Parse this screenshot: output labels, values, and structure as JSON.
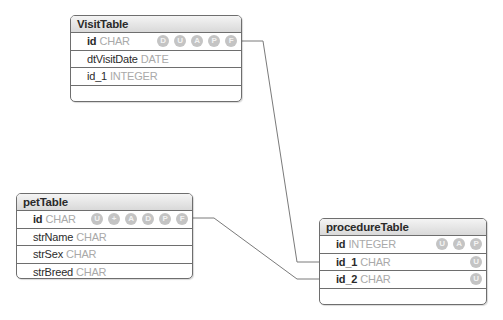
{
  "tables": {
    "visit": {
      "name": "VisitTable",
      "fields": [
        {
          "name": "id",
          "type": "CHAR",
          "icons": [
            "D",
            "U",
            "A",
            "P",
            "F"
          ]
        },
        {
          "name": "dtVisitDate",
          "type": "DATE",
          "icons": []
        },
        {
          "name": "id_1",
          "type": "INTEGER",
          "icons": []
        }
      ]
    },
    "pet": {
      "name": "petTable",
      "fields": [
        {
          "name": "id",
          "type": "CHAR",
          "icons": [
            "U",
            "+",
            "A",
            "D",
            "P",
            "F"
          ]
        },
        {
          "name": "strName",
          "type": "CHAR",
          "icons": []
        },
        {
          "name": "strSex",
          "type": "CHAR",
          "icons": []
        },
        {
          "name": "strBreed",
          "type": "CHAR",
          "icons": []
        }
      ]
    },
    "procedure": {
      "name": "procedureTable",
      "fields": [
        {
          "name": "id",
          "type": "INTEGER",
          "icons": [
            "U",
            "A",
            "P"
          ]
        },
        {
          "name": "id_1",
          "type": "CHAR",
          "icons": [
            "U"
          ]
        },
        {
          "name": "id_2",
          "type": "CHAR",
          "icons": [
            "U"
          ]
        }
      ]
    }
  },
  "relationships": [
    {
      "from": "VisitTable.id",
      "to": "procedureTable.id_1"
    },
    {
      "from": "petTable.id",
      "to": "procedureTable.id_2"
    }
  ],
  "colors": {
    "border": "#6e6e6e",
    "line": "#7a7a7a",
    "icon": "#c4c4c4",
    "type_text": "#a9a9a9"
  }
}
